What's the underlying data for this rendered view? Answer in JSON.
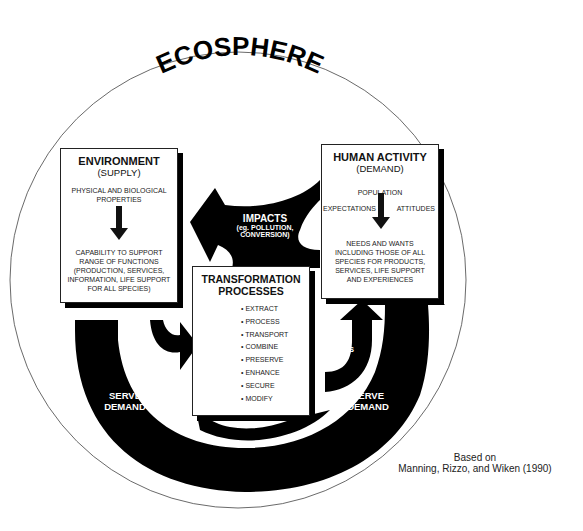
{
  "title": "ECOSPHERE",
  "environment": {
    "title": "ENVIRONMENT",
    "subtitle": "(SUPPLY)",
    "top_text": "PHYSICAL AND BIOLOGICAL PROPERTIES",
    "bottom_text": "CAPABILITY TO SUPPORT RANGE OF FUNCTIONS (PRODUCTION, SERVICES, INFORMATION, LIFE SUPPORT FOR ALL SPECIES)"
  },
  "human_activity": {
    "title": "HUMAN ACTIVITY",
    "subtitle": "(DEMAND)",
    "population": "POPULATION",
    "expectations": "EXPECTATIONS",
    "attitudes": "ATTITUDES",
    "bottom_text": "NEEDS AND WANTS INCLUDING THOSE OF ALL SPECIES FOR PRODUCTS, SERVICES, LIFE SUPPORT AND EXPERIENCES"
  },
  "transformation": {
    "title_line1": "TRANSFORMATION",
    "title_line2": "PROCESSES",
    "items": [
      "EXTRACT",
      "PROCESS",
      "TRANSPORT",
      "COMBINE",
      "PRESERVE",
      "ENHANCE",
      "SECURE",
      "MODIFY"
    ]
  },
  "arrows": {
    "impacts": "IMPACTS",
    "impacts_sub1": "(eg. POLLUTION,",
    "impacts_sub2": "CONVERSION)",
    "health1": "HEALTH",
    "health2": "EFFECTS",
    "serve_left1": "SERVE",
    "serve_left2": "DEMAND",
    "serve_right1": "SERVE",
    "serve_right2": "DEMAND"
  },
  "credit": {
    "line1": "Based on",
    "line2": "Manning, Rizzo, and Wiken (1990)"
  }
}
